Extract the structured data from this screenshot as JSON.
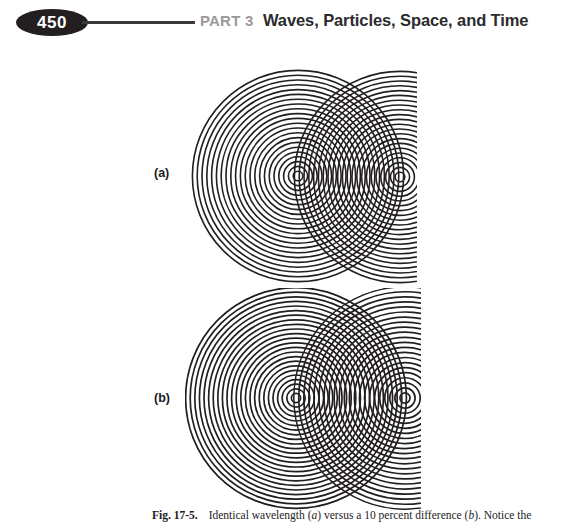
{
  "page": {
    "number": "450",
    "background_color": "#ffffff"
  },
  "running_head": {
    "part_label": "PART 3",
    "title": "Waves, Particles, Space, and Time",
    "part_label_color": "#9a9a9c",
    "title_color": "#2b2b2d",
    "rule_color": "#3a3a3c",
    "badge_color": "#231f20"
  },
  "figure": {
    "panels": [
      {
        "label": "(a)",
        "name": "panel-a"
      },
      {
        "label": "(b)",
        "name": "panel-b"
      }
    ],
    "caption": {
      "label": "Fig. 17-5.",
      "text_part_1": "Identical wavelength (",
      "italic_1": "a",
      "text_part_2": ") versus a 10 percent difference (",
      "italic_2": "b",
      "text_part_3": "). Notice the"
    },
    "ink_color": "#231f20"
  },
  "chart_data": {
    "type": "scatter",
    "xlabel": "",
    "ylabel": "",
    "panels": [
      {
        "name": "a",
        "label": "(a)",
        "description": "Identical wavelength: two coincident ring spacings produce symmetric interference fringes",
        "sources": [
          {
            "id": "S1",
            "cx": 113,
            "cy": 113,
            "wavelength": 4.8,
            "ring_count": 23
          },
          {
            "id": "S2",
            "cx": 215,
            "cy": 114,
            "wavelength": 4.8,
            "ring_count": 23
          }
        ],
        "source_separation": 102,
        "max_radius": 110,
        "stroke_width": 1.6
      },
      {
        "name": "b",
        "label": "(b)",
        "description": "10 percent wavelength difference: ring spacings differ, producing asymmetric drifting fringes",
        "sources": [
          {
            "id": "S1",
            "cx": 111,
            "cy": 110,
            "wavelength": 4.6,
            "ring_count": 24
          },
          {
            "id": "S2",
            "cx": 220,
            "cy": 110,
            "wavelength": 5.06,
            "ring_count": 22
          }
        ],
        "source_separation": 109,
        "max_radius": 112,
        "stroke_width": 1.7
      }
    ],
    "legend_position": "none",
    "grid": false
  }
}
